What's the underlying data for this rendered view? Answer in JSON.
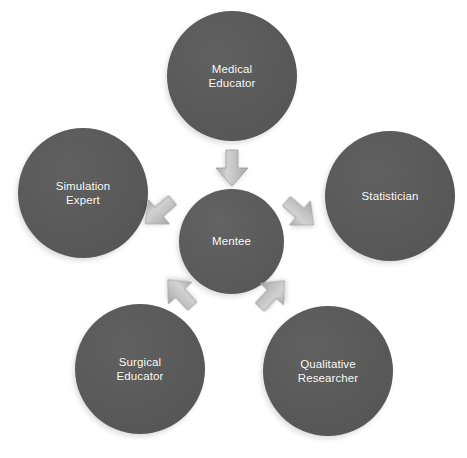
{
  "diagram": {
    "type": "hub-and-spoke",
    "title": "",
    "background_color": "#ffffff",
    "node_color": "#595959",
    "node_text_color": "#ffffff",
    "arrow_color": "#b9b9b9",
    "center": {
      "id": "mentee",
      "label": "Mentee"
    },
    "satellites": [
      {
        "id": "medical-educator",
        "label": "Medical\nEducator",
        "position": "top"
      },
      {
        "id": "simulation-expert",
        "label": "Simulation\nExpert",
        "position": "left"
      },
      {
        "id": "statistician",
        "label": "Statistician",
        "position": "right"
      },
      {
        "id": "surgical-educator",
        "label": "Surgical\nEducator",
        "position": "bottom-left"
      },
      {
        "id": "qualitative-researcher",
        "label": "Qualitative\nResearcher",
        "position": "bottom-right"
      }
    ],
    "arrows": [
      {
        "id": "medical-to-mentee",
        "from": "medical-educator",
        "to": "mentee",
        "icon": "arrow-down-icon"
      },
      {
        "id": "simulation-to-mentee",
        "from": "simulation-expert",
        "to": "mentee",
        "icon": "arrow-right-down-icon"
      },
      {
        "id": "statistician-to-mentee",
        "from": "statistician",
        "to": "mentee",
        "icon": "arrow-left-down-icon"
      },
      {
        "id": "surgical-to-mentee",
        "from": "surgical-educator",
        "to": "mentee",
        "icon": "arrow-up-right-icon"
      },
      {
        "id": "qualitative-to-mentee",
        "from": "qualitative-researcher",
        "to": "mentee",
        "icon": "arrow-up-left-icon"
      }
    ]
  }
}
